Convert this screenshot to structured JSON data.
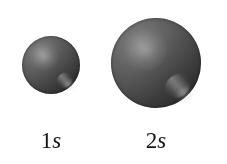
{
  "figure": {
    "background_color": "#ffffff",
    "width": 227,
    "height": 164,
    "caption_color": "#151515"
  },
  "orbitals": [
    {
      "id": "1s",
      "label_number": "1",
      "label_subshell": "s",
      "icon_name": "sphere-orbital-1s",
      "diameter_px": 58,
      "center_x": 51,
      "center_y": 65,
      "surface": {
        "body_color": "#6a6a6a",
        "rim_color": "#1e1e1e",
        "highlight_color": "#9a9a9a",
        "glint_color": "#d2d2d2"
      }
    },
    {
      "id": "2s",
      "label_number": "2",
      "label_subshell": "s",
      "icon_name": "sphere-orbital-2s",
      "diameter_px": 90,
      "center_x": 156,
      "center_y": 63,
      "surface": {
        "body_color": "#6a6a6a",
        "rim_color": "#1e1e1e",
        "highlight_color": "#9a9a9a",
        "glint_color": "#d2d2d2"
      }
    }
  ]
}
